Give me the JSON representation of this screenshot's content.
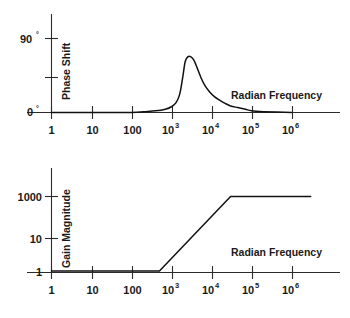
{
  "figure": {
    "title": "",
    "background_color": "#ffffff",
    "line_color": "#111111",
    "axis_color": "#2b2b2b"
  },
  "chart_data": [
    {
      "type": "line",
      "id": "phase-shift-plot",
      "title": "",
      "xlabel": "Radian Frequency",
      "ylabel": "Phase Shift",
      "xscale": "log",
      "xlim": [
        1,
        10000000
      ],
      "ylim": [
        0,
        100
      ],
      "grid": false,
      "legend": null,
      "xticklabels": [
        "1",
        "10",
        "100",
        "10",
        "10",
        "10",
        "10"
      ],
      "xtick_exponents": [
        "",
        "",
        "",
        "3",
        "4",
        "5",
        "6"
      ],
      "xticks": [
        1,
        10,
        100,
        1000,
        10000,
        100000,
        1000000
      ],
      "yticklabels": [
        "0",
        "",
        "90"
      ],
      "ytick_degree_symbol": "°",
      "yticks": [
        0,
        45,
        90
      ],
      "series": [
        {
          "name": "Phase Shift",
          "comment": "resonant phase bump peaking near 68 degrees around w=2000",
          "x": [
            1,
            10,
            100,
            200,
            400,
            700,
            1000,
            1300,
            1600,
            1900,
            2200,
            2600,
            3000,
            3600,
            4400,
            5500,
            7000,
            9000,
            12000,
            16000,
            22000,
            30000,
            45000,
            70000,
            100000,
            200000,
            1000000
          ],
          "y": [
            0,
            0,
            0,
            1,
            2,
            4,
            7,
            12,
            22,
            42,
            62,
            68,
            68,
            64,
            54,
            42,
            32,
            25,
            19,
            15,
            11,
            8,
            6,
            4,
            2,
            1,
            0
          ]
        }
      ]
    },
    {
      "type": "line",
      "id": "gain-magnitude-plot",
      "title": "",
      "xlabel": "Radian Frequency",
      "ylabel": "Gain Magnitude",
      "xscale": "log",
      "yscale": "log",
      "xlim": [
        1,
        10000000
      ],
      "ylim": [
        1,
        10000
      ],
      "grid": false,
      "legend": null,
      "xticklabels": [
        "1",
        "10",
        "100",
        "10",
        "10",
        "10",
        "10"
      ],
      "xtick_exponents": [
        "",
        "",
        "",
        "3",
        "4",
        "5",
        "6"
      ],
      "xticks": [
        1,
        10,
        100,
        1000,
        10000,
        100000,
        1000000
      ],
      "yticklabels": [
        "1",
        "10",
        "1000"
      ],
      "yticks": [
        1,
        10,
        1000
      ],
      "series": [
        {
          "name": "Gain Magnitude",
          "comment": "flat at gain 1 until ~500 rad/s, +60 dB/decade rise to 1000, then flat plateau",
          "x": [
            1,
            10,
            100,
            500,
            30000,
            3000000
          ],
          "y": [
            1,
            1,
            1,
            1,
            1000,
            1000
          ]
        }
      ]
    }
  ]
}
